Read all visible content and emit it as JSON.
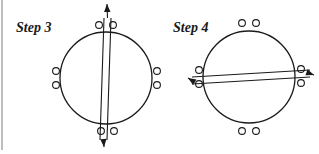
{
  "colors": {
    "stroke": "#1a1a1a",
    "border": "#a8a8a8",
    "background": "#ffffff"
  },
  "panels": [
    {
      "label": "Step 3",
      "label_pos": [
        16,
        21
      ],
      "circle": {
        "cx": 106,
        "cy": 78,
        "r": 46
      },
      "holes": [
        [
          99,
          25
        ],
        [
          113,
          25
        ],
        [
          101,
          131
        ],
        [
          114,
          131
        ],
        [
          56,
          71
        ],
        [
          56,
          85
        ],
        [
          157,
          71
        ],
        [
          157,
          85
        ]
      ],
      "strap": {
        "line1": [
          [
            104,
            18
          ],
          [
            100,
            140
          ]
        ],
        "line2": [
          [
            111,
            18
          ],
          [
            107,
            140
          ]
        ],
        "arrow_start": [
          107,
          4
        ],
        "arrow_end": [
          104,
          147
        ]
      },
      "orientation": "vertical"
    },
    {
      "label": "Step 4",
      "label_pos": [
        173,
        21
      ],
      "circle": {
        "cx": 249,
        "cy": 77,
        "r": 46
      },
      "holes": [
        [
          242,
          23
        ],
        [
          256,
          23
        ],
        [
          242,
          131
        ],
        [
          256,
          131
        ],
        [
          199,
          70
        ],
        [
          199,
          84
        ],
        [
          301,
          69
        ],
        [
          301,
          83
        ]
      ],
      "strap": {
        "line1": [
          [
            192,
            77
          ],
          [
            310,
            70
          ]
        ],
        "line2": [
          [
            192,
            84
          ],
          [
            310,
            77
          ]
        ],
        "arrow_start": [
          188,
          78
        ],
        "arrow_end": [
          314,
          75
        ]
      },
      "orientation": "horizontal"
    }
  ]
}
